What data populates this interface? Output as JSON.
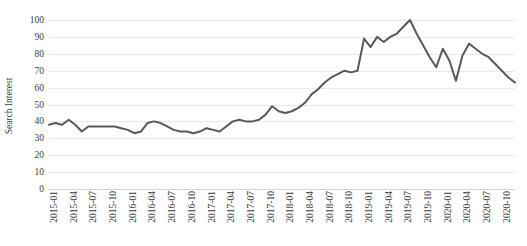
{
  "chart_data": {
    "type": "line",
    "title": "",
    "xlabel": "",
    "ylabel": "Search Interest",
    "ylim": [
      0,
      100
    ],
    "ytick_labels": [
      "100",
      "90",
      "80",
      "70",
      "60",
      "50",
      "40",
      "30",
      "20",
      "10",
      "0"
    ],
    "ytick_values": [
      100,
      90,
      80,
      70,
      60,
      50,
      40,
      30,
      20,
      10,
      0
    ],
    "grid": true,
    "legend": "none",
    "line_color": "#595959",
    "line_width": 2,
    "xtick_labels": [
      "2015-01",
      "2015-04",
      "2015-07",
      "2015-10",
      "2016-01",
      "2016-04",
      "2016-07",
      "2016-10",
      "2017-01",
      "2017-04",
      "2017-07",
      "2017-10",
      "2018-01",
      "2018-04",
      "2018-07",
      "2018-10",
      "2019-01",
      "2019-04",
      "2019-07",
      "2019-10",
      "2020-01",
      "2020-04",
      "2020-07",
      "2020-10"
    ],
    "xtick_indices": [
      0,
      3,
      6,
      9,
      12,
      15,
      18,
      21,
      24,
      27,
      30,
      33,
      36,
      39,
      42,
      45,
      48,
      51,
      54,
      57,
      60,
      63,
      66,
      69
    ],
    "x": [
      "2015-01",
      "2015-02",
      "2015-03",
      "2015-04",
      "2015-05",
      "2015-06",
      "2015-07",
      "2015-08",
      "2015-09",
      "2015-10",
      "2015-11",
      "2015-12",
      "2016-01",
      "2016-02",
      "2016-03",
      "2016-04",
      "2016-05",
      "2016-06",
      "2016-07",
      "2016-08",
      "2016-09",
      "2016-10",
      "2016-11",
      "2016-12",
      "2017-01",
      "2017-02",
      "2017-03",
      "2017-04",
      "2017-05",
      "2017-06",
      "2017-07",
      "2017-08",
      "2017-09",
      "2017-10",
      "2017-11",
      "2017-12",
      "2018-01",
      "2018-02",
      "2018-03",
      "2018-04",
      "2018-05",
      "2018-06",
      "2018-07",
      "2018-08",
      "2018-09",
      "2018-10",
      "2018-11",
      "2018-12",
      "2019-01",
      "2019-02",
      "2019-03",
      "2019-04",
      "2019-05",
      "2019-06",
      "2019-07",
      "2019-08",
      "2019-09",
      "2019-10",
      "2019-11",
      "2019-12",
      "2020-01",
      "2020-02",
      "2020-03",
      "2020-04",
      "2020-05",
      "2020-06",
      "2020-07",
      "2020-08",
      "2020-09",
      "2020-10",
      "2020-11",
      "2020-12"
    ],
    "values": [
      38,
      39,
      38,
      41,
      38,
      34,
      37,
      37,
      37,
      37,
      37,
      36,
      35,
      33,
      34,
      39,
      40,
      39,
      37,
      35,
      34,
      34,
      33,
      34,
      36,
      35,
      34,
      37,
      40,
      41,
      40,
      40,
      41,
      44,
      49,
      46,
      45,
      46,
      48,
      51,
      56,
      59,
      63,
      66,
      68,
      70,
      69,
      70,
      89,
      84,
      90,
      87,
      90,
      92,
      96,
      100,
      92,
      85,
      78,
      72,
      83,
      76,
      64,
      79,
      86,
      83,
      80,
      78,
      74,
      70,
      66,
      63
    ]
  }
}
